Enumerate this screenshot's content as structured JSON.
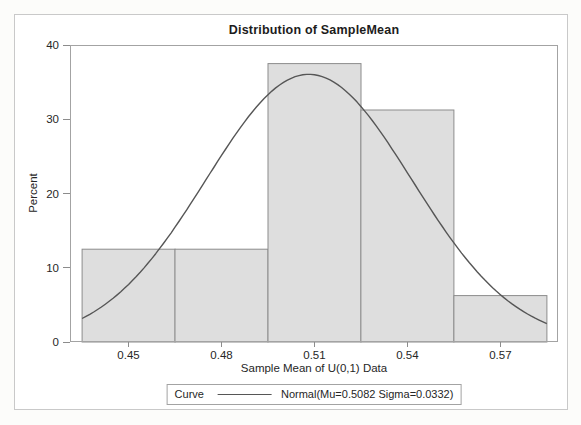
{
  "chart_data": {
    "type": "histogram",
    "title": "Distribution of SampleMean",
    "xlabel": "Sample Mean of U(0,1) Data",
    "ylabel": "Percent",
    "xlim": [
      0.4311,
      0.5886
    ],
    "ylim": [
      0,
      40
    ],
    "grid": false,
    "x_ticks": {
      "values": [
        0.45,
        0.48,
        0.51,
        0.54,
        0.57
      ],
      "labels": [
        "0.45",
        "0.48",
        "0.51",
        "0.54",
        "0.57"
      ]
    },
    "y_ticks": {
      "values": [
        0,
        10,
        20,
        30,
        40
      ],
      "labels": [
        "0",
        "10",
        "20",
        "30",
        "40"
      ]
    },
    "bins": {
      "edges": [
        0.435,
        0.465,
        0.495,
        0.525,
        0.555,
        0.585
      ],
      "centers": [
        0.45,
        0.48,
        0.51,
        0.54,
        0.57
      ],
      "percent_values": [
        12.5,
        12.5,
        37.5,
        31.25,
        6.25
      ]
    },
    "curve": {
      "family": "normal",
      "mu": 0.5082,
      "sigma": 0.0332,
      "label": "Normal(Mu=0.5082 Sigma=0.0332)"
    },
    "legend": {
      "position": "bottom-center",
      "title": "Curve"
    }
  },
  "colors": {
    "bar_fill": "#dedede",
    "bar_stroke": "#8c8c8c",
    "curve": "#565656",
    "plot_frame": "#a3a3a3",
    "tick": "#8c8c8c",
    "text": "#1c1c1c",
    "outer_border": "#c9c9c9"
  }
}
